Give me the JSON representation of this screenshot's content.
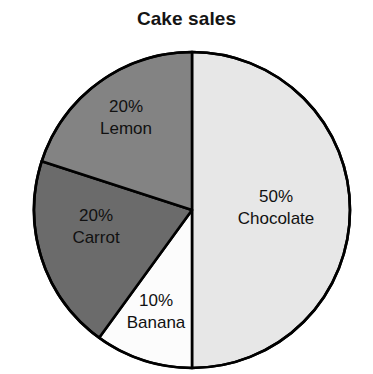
{
  "chart_data": {
    "type": "pie",
    "title": "Cake sales",
    "xlabel": "",
    "ylabel": "",
    "categories": [
      "Chocolate",
      "Banana",
      "Carrot",
      "Lemon"
    ],
    "values": [
      50,
      10,
      20,
      20
    ],
    "unit": "%",
    "legend_position": "none",
    "grid": false,
    "labels_inside_slices": true,
    "start_angle_deg": 0,
    "direction": "clockwise",
    "slices": [
      {
        "name": "Chocolate",
        "value": 50,
        "percent_label": "50%",
        "name_label": "Chocolate",
        "color": "#e7e7e7",
        "start_deg": 0,
        "end_deg": 180
      },
      {
        "name": "Banana",
        "value": 10,
        "percent_label": "10%",
        "name_label": "Banana",
        "color": "#fcfcfc",
        "start_deg": 180,
        "end_deg": 216
      },
      {
        "name": "Carrot",
        "value": 20,
        "percent_label": "20%",
        "name_label": "Carrot",
        "color": "#6b6b6b",
        "start_deg": 216,
        "end_deg": 288
      },
      {
        "name": "Lemon",
        "value": 20,
        "percent_label": "20%",
        "name_label": "Lemon",
        "color": "#838383",
        "start_deg": 288,
        "end_deg": 360
      }
    ],
    "geometry": {
      "center_x": 192,
      "center_y": 210,
      "radius": 158
    },
    "stroke_color": "#000000",
    "background": "#ffffff"
  }
}
